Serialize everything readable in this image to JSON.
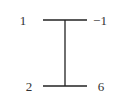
{
  "diagram": {
    "type": "i-beam-graph",
    "line_color": "#222222",
    "top_bar": {
      "left_label": "1",
      "right_label": "−1"
    },
    "bottom_bar": {
      "left_label": "2",
      "right_label": "6"
    }
  }
}
